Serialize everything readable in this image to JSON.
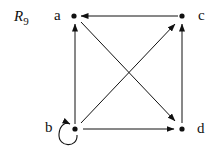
{
  "relation": {
    "name": "R",
    "subscript": "9"
  },
  "nodes": [
    {
      "id": "a",
      "label": "a"
    },
    {
      "id": "b",
      "label": "b"
    },
    {
      "id": "c",
      "label": "c"
    },
    {
      "id": "d",
      "label": "d"
    }
  ],
  "edges": [
    {
      "from": "c",
      "to": "a"
    },
    {
      "from": "b",
      "to": "a"
    },
    {
      "from": "a",
      "to": "d"
    },
    {
      "from": "b",
      "to": "c"
    },
    {
      "from": "d",
      "to": "c"
    },
    {
      "from": "b",
      "to": "d"
    },
    {
      "from": "b",
      "to": "b",
      "type": "self-loop"
    }
  ]
}
